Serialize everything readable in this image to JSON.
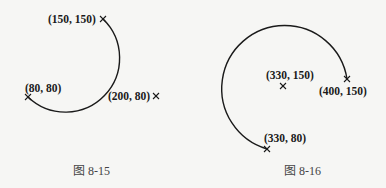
{
  "figures": [
    {
      "caption": "图 8-15",
      "points": [
        {
          "label": "(150, 150)"
        },
        {
          "label": "(80, 80)"
        },
        {
          "label": "(200, 80)"
        }
      ]
    },
    {
      "caption": "图 8-16",
      "points": [
        {
          "label": "(330, 150)"
        },
        {
          "label": "(400, 150)"
        },
        {
          "label": "(330, 80)"
        }
      ]
    }
  ],
  "colors": {
    "stroke": "#1a1a1a",
    "background": "#f6f6f4",
    "caption": "#444444"
  }
}
